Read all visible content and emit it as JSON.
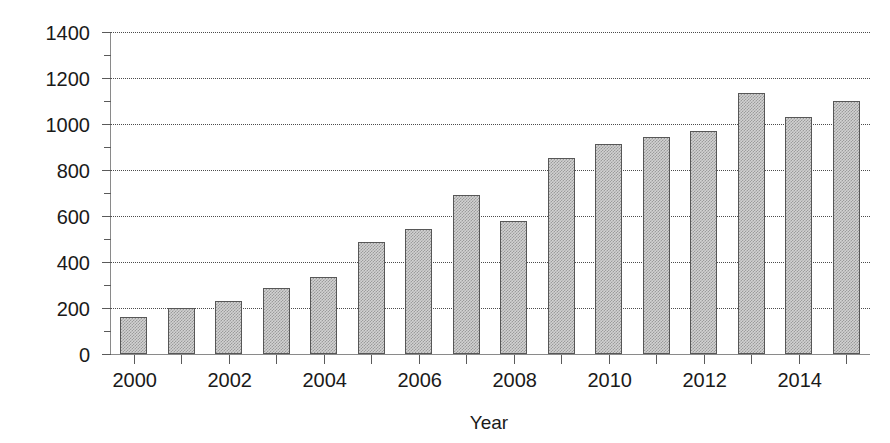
{
  "chart_data": {
    "type": "bar",
    "title": "",
    "xlabel": "Year",
    "ylabel": "Million sq.m.",
    "categories": [
      "2000",
      "2001",
      "2002",
      "2003",
      "2004",
      "2005",
      "2006",
      "2007",
      "2008",
      "2009",
      "2010",
      "2011",
      "2012",
      "2013",
      "2014",
      "2015"
    ],
    "values": [
      160,
      198,
      230,
      285,
      335,
      485,
      545,
      690,
      580,
      852,
      912,
      945,
      968,
      1135,
      1030,
      1098
    ],
    "ylim": [
      0,
      1400
    ],
    "xlim_categories": 16,
    "grid": true,
    "gridlines_at": [
      200,
      400,
      600,
      800,
      1000,
      1200,
      1400
    ],
    "legend": "none",
    "y_major_ticks": [
      0,
      200,
      400,
      600,
      800,
      1000,
      1200,
      1400
    ],
    "y_minor_ticks": [
      100,
      300,
      500,
      700,
      900,
      1100,
      1300
    ],
    "y_tick_labels": [
      "0",
      "200",
      "400",
      "600",
      "800",
      "1000",
      "1200",
      "1400"
    ],
    "x_tick_labels_shown": [
      "2000",
      "2002",
      "2004",
      "2006",
      "2008",
      "2010",
      "2012",
      "2014"
    ],
    "bar_fill_color": "#d2d2d2",
    "bar_edge_color": "#575757",
    "axis_color": "#8a8a8a",
    "grid_color": "#4c4c4c",
    "text_color": "#1a1a1a"
  }
}
